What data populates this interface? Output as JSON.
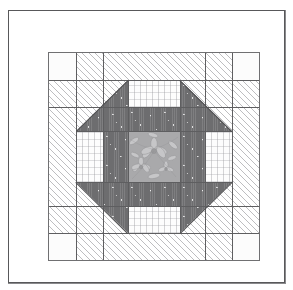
{
  "document": {
    "title": "Quilt Block Diagram",
    "kind": "pieced-quilt-block-line-drawing"
  },
  "frame": {
    "name": "outer-border-frame",
    "stroke_color": "#58585a",
    "fill_color": "#ffffff"
  },
  "block": {
    "name": "quilt-block",
    "grid": "5x5",
    "border_color": "#707072",
    "pattern_name": "Arrow / Double-X medallion block"
  },
  "fabrics": [
    {
      "id": "dark",
      "label": "dark speckled solid",
      "color": "#6d6d6f"
    },
    {
      "id": "hatch",
      "label": "light diagonal hatch print",
      "color": "#ffffff"
    },
    {
      "id": "light-print",
      "label": "light dashed-line print",
      "color": "#fdfdfd"
    },
    {
      "id": "plain",
      "label": "plain light cloth",
      "color": "#fcfcfc"
    },
    {
      "id": "floral",
      "label": "grey floral print",
      "color": "#a9a9ab"
    }
  ],
  "pieces": {
    "center_square": {
      "fabric": "floral",
      "label": "centre floral square"
    },
    "side_bars": {
      "fabric": "dark",
      "label": "dark side bars",
      "count": 4
    },
    "corner_triangles": {
      "fabric": "dark",
      "label": "dark arrow triangles",
      "count": 4
    },
    "edge_rectangles": {
      "fabric": "light-print",
      "label": "light print rectangles",
      "count": 4
    },
    "corner_squares": {
      "fabric": "hatch",
      "label": "hatched corner squares",
      "count": 4
    },
    "corner_small_squares": {
      "fabric": "plain",
      "label": "plain corner accents",
      "count": 4
    }
  }
}
